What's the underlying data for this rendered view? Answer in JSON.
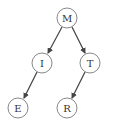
{
  "figure": {
    "partial_label": ")",
    "type": "binary tree",
    "nodes": [
      {
        "id": "M",
        "label": "M",
        "cx": 67,
        "cy": 18
      },
      {
        "id": "I",
        "label": "I",
        "cx": 42,
        "cy": 63
      },
      {
        "id": "T",
        "label": "T",
        "cx": 90,
        "cy": 63
      },
      {
        "id": "E",
        "label": "E",
        "cx": 18,
        "cy": 108
      },
      {
        "id": "R",
        "label": "R",
        "cx": 67,
        "cy": 108
      }
    ],
    "edges": [
      {
        "from": "M",
        "to": "I"
      },
      {
        "from": "M",
        "to": "T"
      },
      {
        "from": "I",
        "to": "E"
      },
      {
        "from": "T",
        "to": "R"
      }
    ],
    "colors": {
      "node_stroke": "#888888",
      "edge": "#444444",
      "text": "#333333"
    }
  }
}
